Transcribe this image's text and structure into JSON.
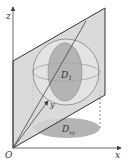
{
  "figure": {
    "type": "3d-geometry-diagram",
    "axes": {
      "origin_label": "O",
      "x_label": "x",
      "y_label": "y",
      "z_label": "z"
    },
    "regions": {
      "plane_section_label": "D",
      "plane_section_subscript": "1",
      "projection_label": "D",
      "projection_subscript": "xy"
    },
    "colors": {
      "plane_fill": "#d4d4d4",
      "sphere_fill": "#e4e4e4",
      "section_fill": "#a8a8a8",
      "projection_fill": "#b4b4b4",
      "line": "#444444",
      "background": "#ffffff"
    }
  }
}
